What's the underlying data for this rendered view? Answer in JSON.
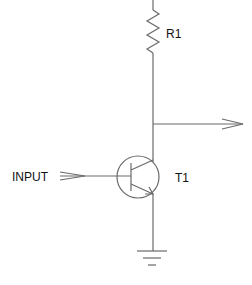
{
  "diagram": {
    "type": "transistor-switch-schematic",
    "colors": {
      "wire": "#6a6a6a",
      "text": "#111111",
      "background": "#ffffff"
    },
    "components": [
      {
        "id": "R1",
        "label": "R1",
        "kind": "resistor"
      },
      {
        "id": "T1",
        "label": "T1",
        "kind": "npn-transistor"
      }
    ],
    "ports": {
      "input": {
        "label": "INPUT"
      },
      "output": {
        "label": ""
      }
    },
    "ground": {
      "kind": "ground-symbol"
    }
  }
}
